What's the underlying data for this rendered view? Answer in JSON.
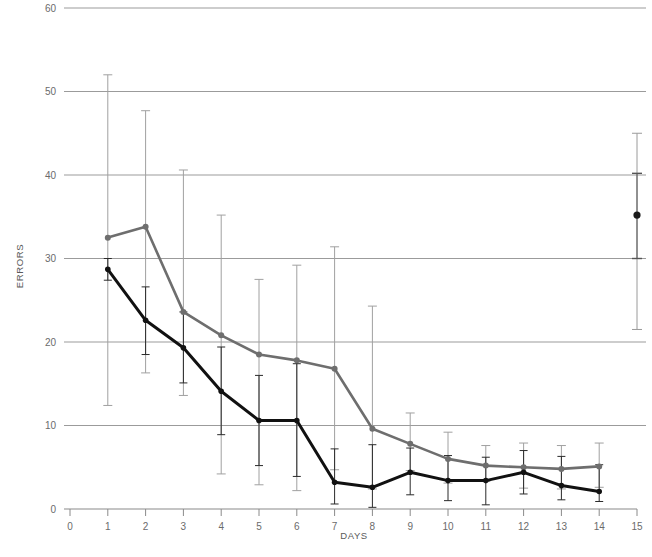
{
  "chart_data": {
    "type": "line",
    "title": "",
    "xlabel": "DAYS",
    "ylabel": "ERRORS",
    "xlim": [
      0,
      15
    ],
    "ylim": [
      0,
      60
    ],
    "grid": true,
    "legend": "none",
    "x_ticks": [
      0,
      1,
      2,
      3,
      4,
      5,
      6,
      7,
      8,
      9,
      10,
      11,
      12,
      13,
      14,
      15
    ],
    "y_ticks": [
      0,
      10,
      20,
      30,
      40,
      50,
      60
    ],
    "x": [
      1,
      2,
      3,
      4,
      5,
      6,
      7,
      8,
      9,
      10,
      11,
      12,
      13,
      14
    ],
    "series": [
      {
        "name": "gray-series",
        "color": "#6e6e6e",
        "values": [
          32.5,
          33.8,
          23.6,
          20.8,
          18.5,
          17.8,
          16.8,
          9.6,
          7.8,
          6.0,
          5.2,
          5.0,
          4.8,
          5.1
        ],
        "err_upper": [
          52.0,
          47.7,
          40.6,
          35.2,
          27.5,
          29.2,
          31.4,
          24.3,
          11.5,
          9.2,
          7.6,
          7.9,
          7.6,
          7.9
        ],
        "err_lower": [
          12.4,
          16.3,
          13.6,
          4.2,
          2.9,
          2.2,
          4.7,
          2.4,
          4.6,
          3.1,
          3.3,
          2.5,
          2.4,
          2.6
        ]
      },
      {
        "name": "black-series",
        "color": "#111111",
        "values": [
          28.7,
          22.6,
          19.3,
          14.1,
          10.6,
          10.6,
          3.2,
          2.6,
          4.4,
          3.4,
          3.4,
          4.4,
          2.8,
          2.1
        ],
        "err_upper": [
          30.0,
          26.6,
          23.6,
          19.4,
          16.0,
          17.4,
          7.2,
          7.7,
          7.3,
          6.4,
          6.2,
          7.0,
          6.3,
          5.3
        ],
        "err_lower": [
          27.4,
          18.5,
          15.1,
          8.9,
          5.2,
          3.9,
          0.6,
          0.2,
          1.7,
          1.0,
          0.5,
          1.8,
          1.1,
          0.9
        ]
      }
    ],
    "final_point": {
      "name": "day-15-summary-point",
      "x": 15,
      "value": 35.2,
      "marker_color": "#1a1a1a",
      "outer_err_upper": 45.0,
      "outer_err_lower": 21.5,
      "outer_err_color": "#9a9a9a",
      "inner_err_upper": 40.2,
      "inner_err_lower": 30.0,
      "inner_err_color": "#555555"
    }
  },
  "axes": {
    "y_label": "ERRORS",
    "x_label": "DAYS",
    "y_tick_labels": [
      "0",
      "10",
      "20",
      "30",
      "40",
      "50",
      "60"
    ],
    "x_tick_labels": [
      "0",
      "1",
      "2",
      "3",
      "4",
      "5",
      "6",
      "7",
      "8",
      "9",
      "10",
      "11",
      "12",
      "13",
      "14",
      "15"
    ]
  },
  "style": {
    "grid_color": "#9b9b9b",
    "axis_color": "#8a8a8a",
    "tick_text_color": "#6b6b6b",
    "background": "#ffffff"
  }
}
